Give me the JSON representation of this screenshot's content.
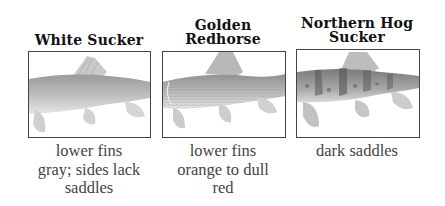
{
  "fish": [
    {
      "name_lines": [
        "White Sucker"
      ],
      "caption_lines": [
        "lower fins",
        "gray; sides lack",
        "saddles"
      ],
      "image": "white-sucker-illustration"
    },
    {
      "name_lines": [
        "Golden",
        "Redhorse"
      ],
      "caption_lines": [
        "lower fins",
        "orange to dull",
        "red"
      ],
      "image": "golden-redhorse-illustration"
    },
    {
      "name_lines": [
        "Northern Hog",
        "Sucker"
      ],
      "caption_lines": [
        "dark saddles"
      ],
      "image": "northern-hog-sucker-illustration"
    }
  ]
}
